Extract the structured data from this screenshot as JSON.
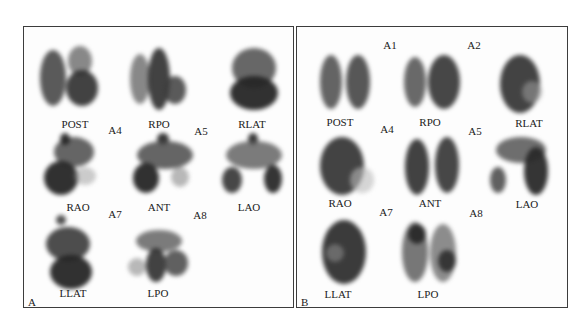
{
  "figure": {
    "panels": [
      {
        "id": "A",
        "label": "A",
        "view_labels": [
          "POST",
          "RPO",
          "RLAT",
          "RAO",
          "ANT",
          "LAO",
          "LLAT",
          "LPO"
        ],
        "annotations": [
          "A4",
          "A5",
          "A7",
          "A8"
        ]
      },
      {
        "id": "B",
        "label": "B",
        "view_labels": [
          "POST",
          "RPO",
          "RLAT",
          "RAO",
          "ANT",
          "LAO",
          "LLAT",
          "LPO"
        ],
        "annotations": [
          "A1",
          "A2",
          "A4",
          "A5",
          "A7",
          "A8"
        ]
      }
    ],
    "colors": {
      "background": "#ffffff",
      "border": "#3c3c3c",
      "uptake_dark": "#2b2b2b",
      "uptake_mid": "#6a6a6a"
    }
  }
}
